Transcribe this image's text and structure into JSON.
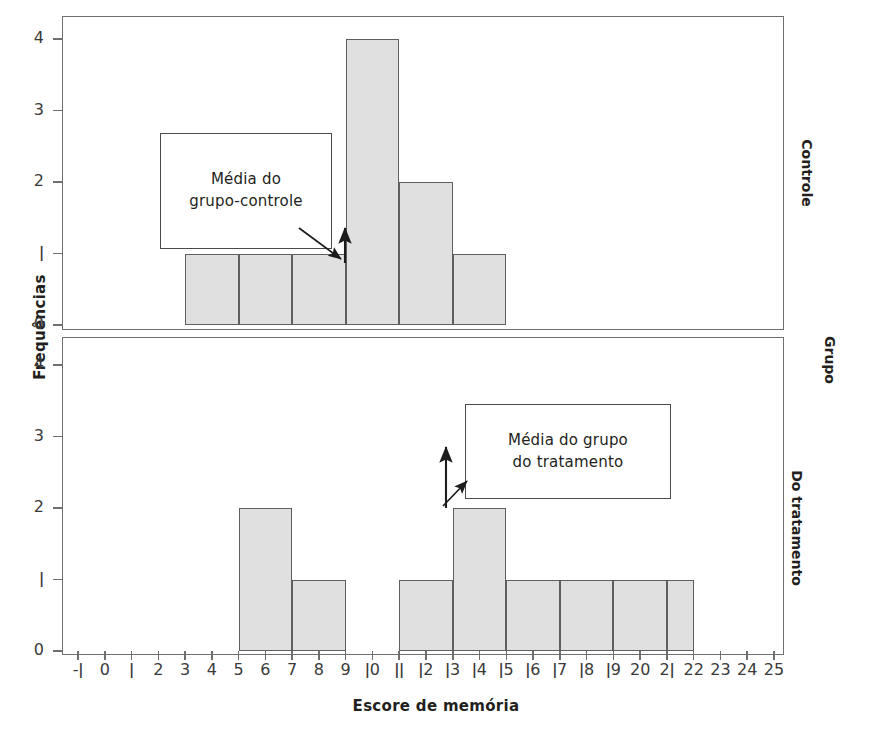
{
  "chart_data": {
    "type": "bar",
    "title": "",
    "xlabel": "Escore de memória",
    "ylabel": "Frequências",
    "right_axis_label": "Grupo",
    "xlim": [
      -1,
      25
    ],
    "ylim": [
      0,
      4
    ],
    "xticks": [
      "-1",
      "0",
      "1",
      "2",
      "3",
      "4",
      "5",
      "6",
      "7",
      "8",
      "9",
      "10",
      "11",
      "12",
      "13",
      "14",
      "15",
      "16",
      "17",
      "18",
      "19",
      "20",
      "21",
      "22",
      "23",
      "24",
      "25"
    ],
    "yticks": [
      "0",
      "1",
      "2",
      "3",
      "4"
    ],
    "grid": false,
    "legend": "none",
    "bin_width": 2,
    "panels": [
      {
        "name": "Controle",
        "label": "Controle",
        "bins": [
          {
            "start": 3,
            "end": 5,
            "value": 1
          },
          {
            "start": 5,
            "end": 7,
            "value": 1
          },
          {
            "start": 7,
            "end": 9,
            "value": 1
          },
          {
            "start": 9,
            "end": 11,
            "value": 4
          },
          {
            "start": 11,
            "end": 13,
            "value": 2
          },
          {
            "start": 13,
            "end": 15,
            "value": 1
          }
        ],
        "annotation": {
          "line1": "Média do",
          "line2": "grupo-controle",
          "marker_x": 9.5
        }
      },
      {
        "name": "Do tratamento",
        "label": "Do tratamento",
        "bins": [
          {
            "start": 5,
            "end": 7,
            "value": 2
          },
          {
            "start": 7,
            "end": 9,
            "value": 1
          },
          {
            "start": 11,
            "end": 13,
            "value": 1
          },
          {
            "start": 13,
            "end": 15,
            "value": 2
          },
          {
            "start": 15,
            "end": 17,
            "value": 1
          },
          {
            "start": 17,
            "end": 19,
            "value": 1
          },
          {
            "start": 19,
            "end": 21,
            "value": 1
          },
          {
            "start": 21,
            "end": 22,
            "value": 1
          }
        ],
        "annotation": {
          "line1": "Média do grupo",
          "line2": "do tratamento",
          "marker_x": 13.0
        }
      }
    ],
    "colors": {
      "bar_fill": "#e0e0e0",
      "bar_stroke": "#5f5f5f",
      "frame": "#6f6f6f",
      "text": "#231f20",
      "tick_text": "#3a3a3a"
    }
  }
}
